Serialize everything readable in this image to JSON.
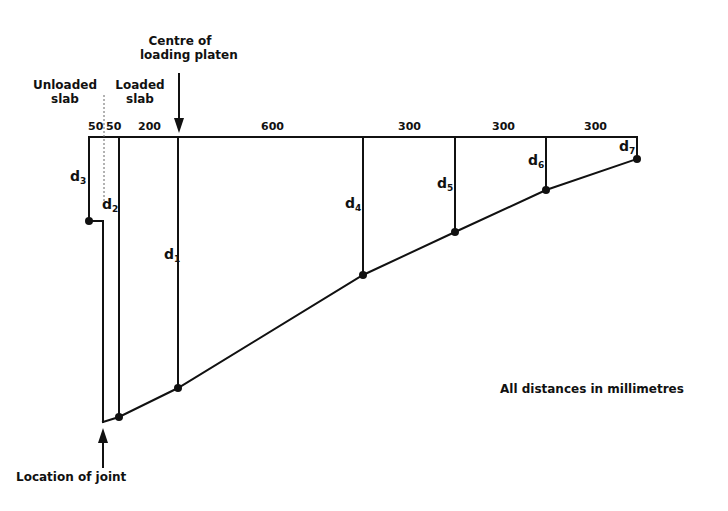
{
  "diagram": {
    "labels": {
      "centre_line1": "Centre of",
      "centre_line2": "loading platen",
      "unloaded_line1": "Unloaded",
      "unloaded_line2": "slab",
      "loaded_line1": "Loaded",
      "loaded_line2": "slab",
      "joint": "Location of joint",
      "units_note": "All distances in millimetres"
    },
    "dimensions": [
      "50",
      "50",
      "200",
      "600",
      "300",
      "300",
      "300"
    ],
    "deflection_points": [
      {
        "name": "d",
        "sub": "3"
      },
      {
        "name": "d",
        "sub": "2"
      },
      {
        "name": "d",
        "sub": "1"
      },
      {
        "name": "d",
        "sub": "4"
      },
      {
        "name": "d",
        "sub": "5"
      },
      {
        "name": "d",
        "sub": "6"
      },
      {
        "name": "d",
        "sub": "7"
      }
    ],
    "colors": {
      "line": "#111111",
      "background": "#ffffff"
    }
  }
}
